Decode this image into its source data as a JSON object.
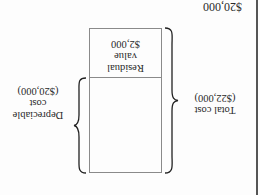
{
  "orientation": "rotated-180",
  "header_value": "$20,000",
  "box": {
    "upper_section": {
      "label_line1": "Residual",
      "label_line2": "value",
      "value": "$2,000"
    },
    "lower_section": {
      "label": ""
    }
  },
  "total_cost": {
    "label": "Total cost",
    "value": "($22,000)"
  },
  "depreciable_cost": {
    "label_line1": "Depreciable",
    "label_line2": "cost",
    "value": "($20,000)"
  },
  "colors": {
    "line": "#8a8a8a",
    "text": "#2a2a2a",
    "edge": "#555555"
  }
}
